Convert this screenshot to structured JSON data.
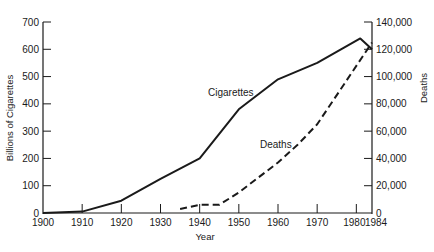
{
  "chart_data": {
    "type": "line",
    "title": "",
    "xlabel": "Year",
    "ylabel_left": "Billions of Cigarettes",
    "ylabel_right": "Deaths",
    "x_ticks": [
      1900,
      1910,
      1920,
      1930,
      1940,
      1950,
      1960,
      1970,
      1980,
      1984
    ],
    "y_left_ticks": [
      0,
      100,
      200,
      300,
      400,
      500,
      600,
      700
    ],
    "y_left_tick_labels": [
      "0",
      "100",
      "200",
      "300",
      "400",
      "500",
      "600",
      "700"
    ],
    "y_right_ticks": [
      0,
      20000,
      40000,
      60000,
      80000,
      100000,
      120000,
      140000
    ],
    "y_right_tick_labels": [
      "0",
      "20,000",
      "40,000",
      "60,000",
      "80,000",
      "100,000",
      "120,000",
      "140,000"
    ],
    "xlim": [
      1900,
      1984
    ],
    "ylim_left": [
      0,
      700
    ],
    "ylim_right": [
      0,
      140000
    ],
    "grid": false,
    "legend": "inline labels",
    "series": [
      {
        "name": "Cigarettes",
        "axis": "left",
        "style": "solid",
        "x": [
          1900,
          1910,
          1920,
          1930,
          1940,
          1950,
          1960,
          1970,
          1981,
          1984
        ],
        "values": [
          0,
          5,
          45,
          125,
          200,
          380,
          490,
          550,
          640,
          600
        ]
      },
      {
        "name": "Deaths",
        "axis": "right",
        "style": "dashed",
        "x": [
          1935,
          1940,
          1945,
          1950,
          1960,
          1965,
          1970,
          1984
        ],
        "values": [
          3000,
          6000,
          6000,
          15000,
          37000,
          50000,
          65000,
          125000
        ]
      }
    ]
  }
}
